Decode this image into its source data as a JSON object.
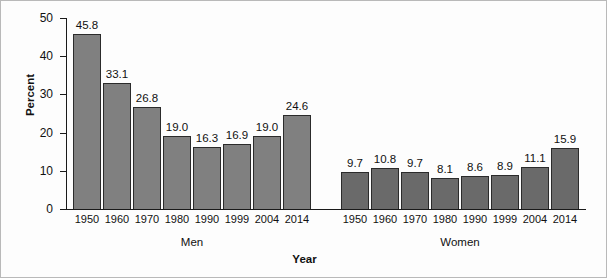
{
  "chart_data": {
    "type": "bar",
    "title": "",
    "xlabel": "Year",
    "ylabel": "Percent",
    "ylim": [
      0,
      50
    ],
    "ytick_labels": [
      "0",
      "10",
      "20",
      "30",
      "40",
      "50"
    ],
    "ytick_values": [
      0,
      10,
      20,
      30,
      40,
      50
    ],
    "grid": false,
    "legend": "none",
    "categories": [
      "1950",
      "1960",
      "1970",
      "1980",
      "1990",
      "1999",
      "2004",
      "2014"
    ],
    "groups": [
      {
        "name": "Men",
        "label": "Men",
        "color": "#808080",
        "values": [
          45.8,
          33.1,
          26.8,
          19.0,
          16.3,
          16.9,
          19.0,
          24.6
        ],
        "value_labels": [
          "45.8",
          "33.1",
          "26.8",
          "19.0",
          "16.3",
          "16.9",
          "19.0",
          "24.6"
        ]
      },
      {
        "name": "Women",
        "label": "Women",
        "color": "#6a6a6a",
        "values": [
          9.7,
          10.8,
          9.7,
          8.1,
          8.6,
          8.9,
          11.1,
          15.9
        ],
        "value_labels": [
          "9.7",
          "10.8",
          "9.7",
          "8.1",
          "8.6",
          "8.9",
          "11.1",
          "15.9"
        ]
      }
    ]
  },
  "colors": {
    "bar_men": "#808080",
    "bar_women": "#6a6a6a",
    "bar_outline": "#2b2b2b",
    "axis": "#1a1a1a",
    "text": "#111111",
    "background": "#fdfdfd",
    "frame": "#b9b9b9"
  }
}
